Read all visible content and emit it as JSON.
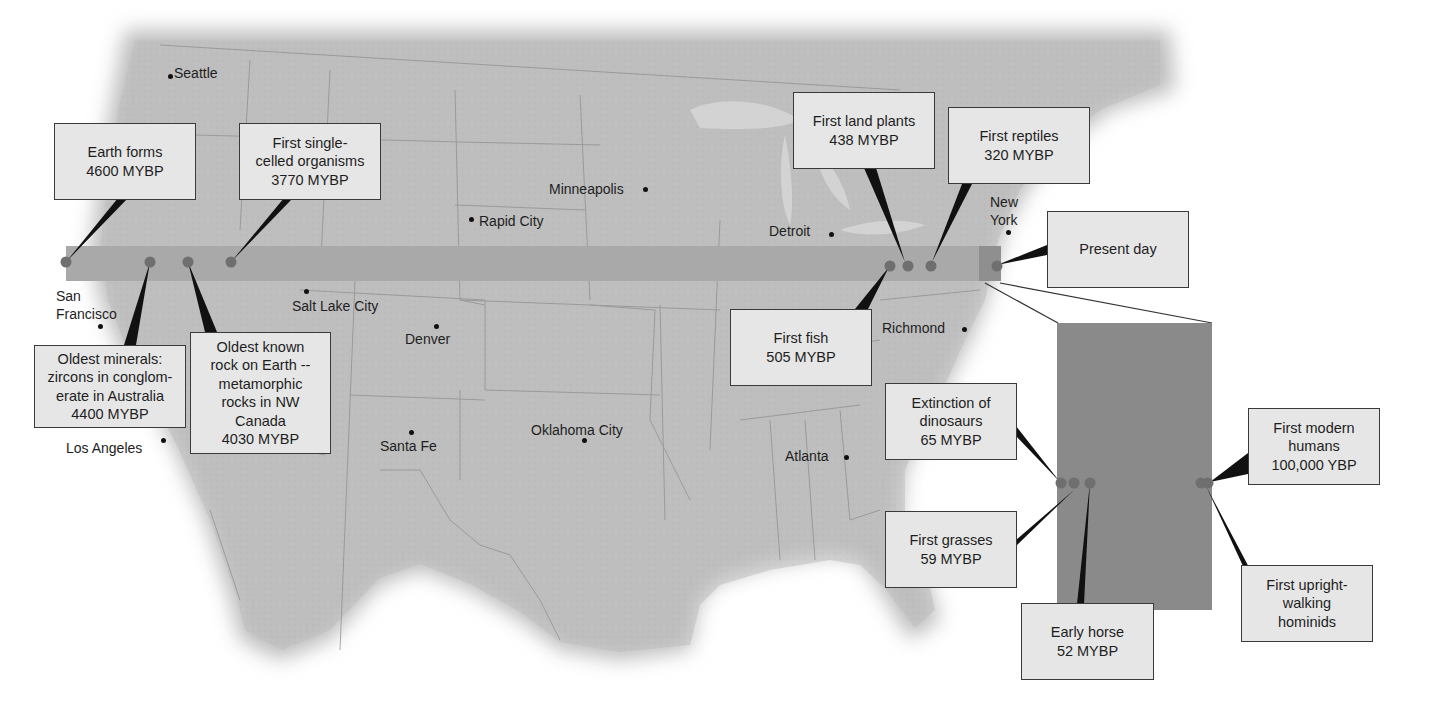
{
  "figure": {
    "timeline_band_color": "#a9a9a9",
    "zoom_panel_color": "#8a8a8a",
    "land_color": "#bdbdbd",
    "callout_fill": "#e6e6e6",
    "event_dot_color": "#6f6f6f"
  },
  "cities": [
    {
      "name": "Seattle",
      "label": "Seattle"
    },
    {
      "name": "San Francisco",
      "label": "San\nFrancisco"
    },
    {
      "name": "Los Angeles",
      "label": "Los Angeles"
    },
    {
      "name": "Salt Lake City",
      "label": "Salt Lake City"
    },
    {
      "name": "Denver",
      "label": "Denver"
    },
    {
      "name": "Santa Fe",
      "label": "Santa Fe"
    },
    {
      "name": "Rapid City",
      "label": "Rapid City"
    },
    {
      "name": "Minneapolis",
      "label": "Minneapolis"
    },
    {
      "name": "Oklahoma City",
      "label": "Oklahoma City"
    },
    {
      "name": "Detroit",
      "label": "Detroit"
    },
    {
      "name": "Richmond",
      "label": "Richmond"
    },
    {
      "name": "Atlanta",
      "label": "Atlanta"
    },
    {
      "name": "New York",
      "label": "New\nYork"
    }
  ],
  "events": [
    {
      "label": "Earth forms\n4600 MYBP",
      "event": "Earth forms",
      "age": "4600 MYBP"
    },
    {
      "label": "Oldest minerals:\nzircons in conglom-\nerate in Australia\n4400 MYBP",
      "event": "Oldest minerals: zircons in conglomerate in Australia",
      "age": "4400 MYBP"
    },
    {
      "label": "Oldest known\nrock on Earth --\nmetamorphic\nrocks in NW\nCanada\n4030 MYBP",
      "event": "Oldest known rock on Earth -- metamorphic rocks in NW Canada",
      "age": "4030 MYBP"
    },
    {
      "label": "First single-\ncelled organisms\n3770 MYBP",
      "event": "First single-celled organisms",
      "age": "3770 MYBP"
    },
    {
      "label": "First fish\n505 MYBP",
      "event": "First fish",
      "age": "505 MYBP"
    },
    {
      "label": "First land plants\n438 MYBP",
      "event": "First land plants",
      "age": "438 MYBP"
    },
    {
      "label": "First reptiles\n320 MYBP",
      "event": "First reptiles",
      "age": "320 MYBP"
    },
    {
      "label": "Present day",
      "event": "Present day",
      "age": ""
    },
    {
      "label": "Extinction of\ndinosaurs\n65 MYBP",
      "event": "Extinction of dinosaurs",
      "age": "65 MYBP"
    },
    {
      "label": "First grasses\n59 MYBP",
      "event": "First grasses",
      "age": "59 MYBP"
    },
    {
      "label": "Early horse\n52 MYBP",
      "event": "Early horse",
      "age": "52 MYBP"
    },
    {
      "label": "First modern\nhumans\n100,000 YBP",
      "event": "First modern humans",
      "age": "100,000 YBP"
    },
    {
      "label": "First upright-\nwalking\nhominids",
      "event": "First upright-walking hominids",
      "age": ""
    }
  ]
}
